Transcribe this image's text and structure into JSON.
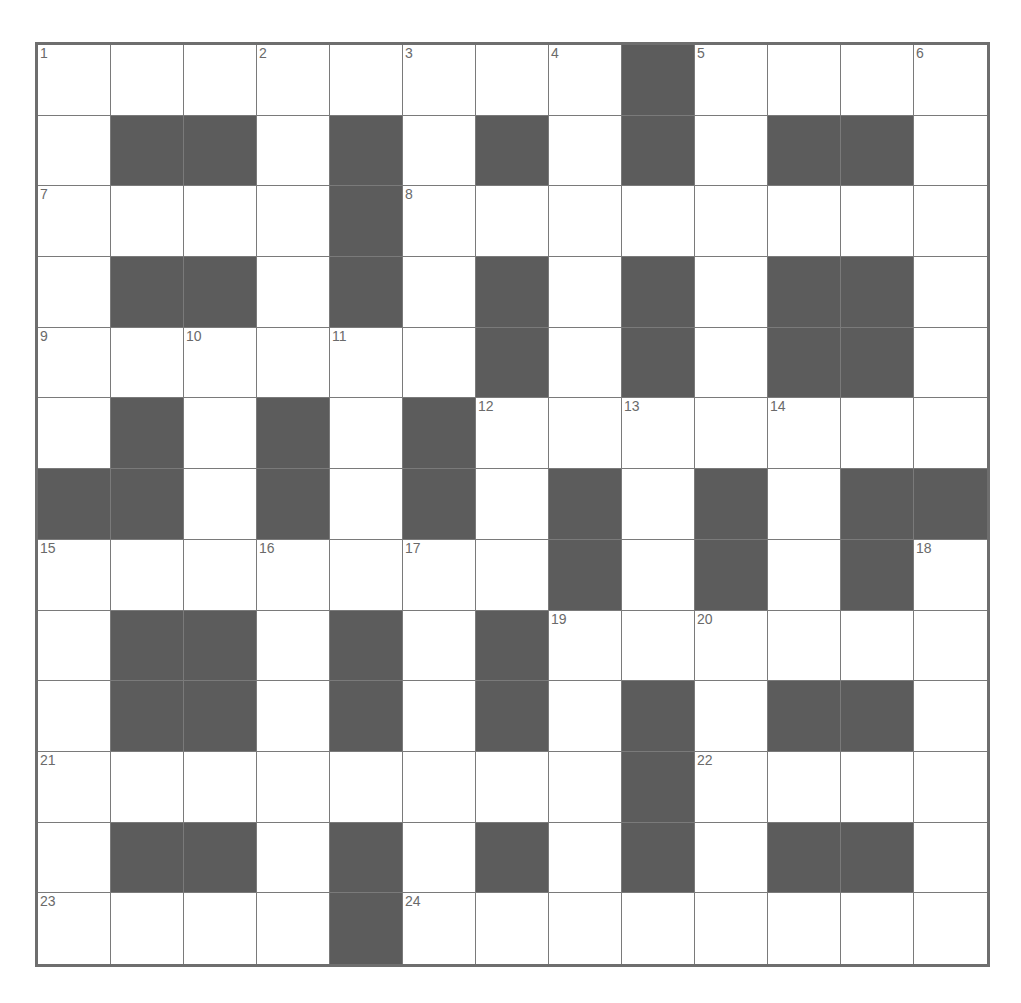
{
  "puzzle": {
    "rows": 13,
    "cols": 13,
    "colors": {
      "block": "#5c5c5c",
      "cell": "#ffffff",
      "gridline": "#7a7a7a",
      "border": "#6e6e6e",
      "number": "#6a6a6a"
    },
    "layout": [
      "WWWWWWWWBWWWW",
      "WBBWBWBWBWBBW",
      "WWWWBWWWWWWWW",
      "WBBWBWBWBWBBW",
      "WWWWWWBWBWBBW",
      "WBWBWBWWWWWWW",
      "BBWBWBWBWBWBB",
      "WWWWWWWBWBWBW",
      "WBBWBWBWWWWWW",
      "WBBWBWBWBWBBW",
      "WWWWWWWWBWWWW",
      "WBBWBWBWBWBBW",
      "WWWWBWWWWWWWW"
    ],
    "numbers": [
      {
        "row": 0,
        "col": 0,
        "n": "1"
      },
      {
        "row": 0,
        "col": 3,
        "n": "2"
      },
      {
        "row": 0,
        "col": 5,
        "n": "3"
      },
      {
        "row": 0,
        "col": 7,
        "n": "4"
      },
      {
        "row": 0,
        "col": 9,
        "n": "5"
      },
      {
        "row": 0,
        "col": 12,
        "n": "6"
      },
      {
        "row": 2,
        "col": 0,
        "n": "7"
      },
      {
        "row": 2,
        "col": 5,
        "n": "8"
      },
      {
        "row": 4,
        "col": 0,
        "n": "9"
      },
      {
        "row": 4,
        "col": 2,
        "n": "10"
      },
      {
        "row": 4,
        "col": 4,
        "n": "11"
      },
      {
        "row": 5,
        "col": 6,
        "n": "12"
      },
      {
        "row": 5,
        "col": 8,
        "n": "13"
      },
      {
        "row": 5,
        "col": 10,
        "n": "14"
      },
      {
        "row": 7,
        "col": 0,
        "n": "15"
      },
      {
        "row": 7,
        "col": 3,
        "n": "16"
      },
      {
        "row": 7,
        "col": 5,
        "n": "17"
      },
      {
        "row": 7,
        "col": 12,
        "n": "18"
      },
      {
        "row": 8,
        "col": 7,
        "n": "19"
      },
      {
        "row": 8,
        "col": 9,
        "n": "20"
      },
      {
        "row": 10,
        "col": 0,
        "n": "21"
      },
      {
        "row": 10,
        "col": 9,
        "n": "22"
      },
      {
        "row": 12,
        "col": 0,
        "n": "23"
      },
      {
        "row": 12,
        "col": 5,
        "n": "24"
      }
    ],
    "entries": {}
  }
}
